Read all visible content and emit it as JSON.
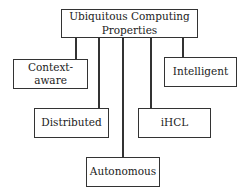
{
  "diagram": {
    "root": {
      "label": "Ubiquitous Computing Properties",
      "line1": "Ubiquitous Computing",
      "line2": "Properties"
    },
    "children": [
      {
        "id": "context-aware",
        "label": "Context-aware"
      },
      {
        "id": "distributed",
        "label": "Distributed"
      },
      {
        "id": "autonomous",
        "label": "Autonomous"
      },
      {
        "id": "ihcl",
        "label": "iHCL"
      },
      {
        "id": "intelligent",
        "label": "Intelligent"
      }
    ]
  }
}
